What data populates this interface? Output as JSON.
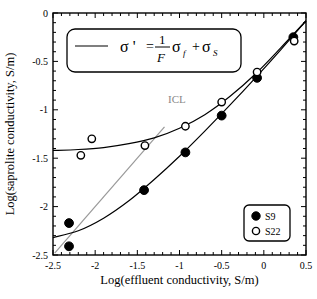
{
  "chart_data": {
    "type": "scatter",
    "title": "",
    "xlabel": "Log(effluent conductivity, S/m)",
    "ylabel": "Log(saprolite conductivity, S/m)",
    "xlim": [
      -2.5,
      0.5
    ],
    "ylim": [
      -2.5,
      0
    ],
    "x_ticks": [
      "-2.5",
      "-2",
      "-1.5",
      "-1",
      "-0.5",
      "0",
      "0.5"
    ],
    "y_ticks": [
      "0",
      "-0.5",
      "-1",
      "-1.5",
      "-2",
      "-2.5"
    ],
    "grid": false,
    "legend_position": "lower right",
    "series": [
      {
        "name": "S9",
        "marker": "filled-circle",
        "points": [
          {
            "x": -2.31,
            "y": -2.17
          },
          {
            "x": -2.31,
            "y": -2.41
          },
          {
            "x": -1.42,
            "y": -1.83
          },
          {
            "x": -0.93,
            "y": -1.44
          },
          {
            "x": -0.5,
            "y": -1.06
          },
          {
            "x": -0.08,
            "y": -0.67
          },
          {
            "x": 0.35,
            "y": -0.25
          }
        ],
        "fit": [
          {
            "x": -2.5,
            "y": -2.32
          },
          {
            "x": -2.2,
            "y": -2.25
          },
          {
            "x": -1.9,
            "y": -2.12
          },
          {
            "x": -1.6,
            "y": -1.94
          },
          {
            "x": -1.3,
            "y": -1.72
          },
          {
            "x": -1.0,
            "y": -1.48
          },
          {
            "x": -0.7,
            "y": -1.22
          },
          {
            "x": -0.4,
            "y": -0.95
          },
          {
            "x": -0.1,
            "y": -0.67
          },
          {
            "x": 0.2,
            "y": -0.38
          },
          {
            "x": 0.5,
            "y": -0.08
          }
        ]
      },
      {
        "name": "S22",
        "marker": "open-circle",
        "points": [
          {
            "x": -2.04,
            "y": -1.3
          },
          {
            "x": -2.17,
            "y": -1.47
          },
          {
            "x": -1.41,
            "y": -1.37
          },
          {
            "x": -0.93,
            "y": -1.17
          },
          {
            "x": -0.5,
            "y": -0.92
          },
          {
            "x": -0.08,
            "y": -0.61
          },
          {
            "x": 0.36,
            "y": -0.29
          }
        ],
        "fit": [
          {
            "x": -2.5,
            "y": -1.42
          },
          {
            "x": -2.2,
            "y": -1.41
          },
          {
            "x": -1.9,
            "y": -1.39
          },
          {
            "x": -1.6,
            "y": -1.35
          },
          {
            "x": -1.3,
            "y": -1.29
          },
          {
            "x": -1.0,
            "y": -1.19
          },
          {
            "x": -0.7,
            "y": -1.05
          },
          {
            "x": -0.4,
            "y": -0.86
          },
          {
            "x": -0.1,
            "y": -0.63
          },
          {
            "x": 0.2,
            "y": -0.36
          },
          {
            "x": 0.5,
            "y": -0.08
          }
        ]
      }
    ],
    "reference_line": {
      "name": "ICL",
      "color": "#999999",
      "from": {
        "x": -2.48,
        "y": -2.48
      },
      "to": {
        "x": -1.0,
        "y": -0.99
      }
    },
    "annotations": {
      "icl_label": "ICL",
      "equation": {
        "lhs": "σ '",
        "eq": "=",
        "numerator": "1",
        "denominator": "F",
        "term1": "σ",
        "term1_sub": "f",
        "plus": "+",
        "term2": "σ",
        "term2_sub": "S"
      }
    }
  },
  "legend": {
    "items": [
      {
        "label": "S9",
        "marker": "filled-circle"
      },
      {
        "label": "S22",
        "marker": "open-circle"
      }
    ]
  },
  "colors": {
    "axis": "#000000",
    "fit_line": "#000000",
    "icl": "#999999",
    "marker_fill_filled": "#000000",
    "marker_fill_open": "#ffffff"
  }
}
